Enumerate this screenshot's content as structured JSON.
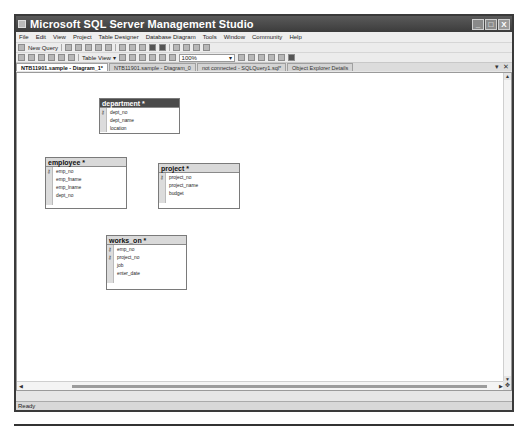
{
  "window": {
    "title": "Microsoft SQL Server Management Studio",
    "controls": {
      "minimize": "_",
      "maximize": "□",
      "close": "X"
    }
  },
  "menu": {
    "items": [
      "File",
      "Edit",
      "View",
      "Project",
      "Table Designer",
      "Database Diagram",
      "Tools",
      "Window",
      "Community",
      "Help"
    ]
  },
  "toolbar1": {
    "new_query_label": "New Query"
  },
  "toolbar2": {
    "table_view_label": "Table View ▾",
    "zoom_value": "100%"
  },
  "tabs": [
    {
      "label": "NTB11901.sample - Diagram_1*",
      "active": true
    },
    {
      "label": "NTB11901.sample - Diagram_0",
      "active": false
    },
    {
      "label": "not connected - SQLQuery1.sql*",
      "active": false
    },
    {
      "label": "Object Explorer Details",
      "active": false
    }
  ],
  "tab_controls": {
    "dropdown": "▾",
    "close": "✕"
  },
  "diagram": {
    "tables": [
      {
        "name": "department *",
        "columns": [
          {
            "name": "dept_no",
            "key": true
          },
          {
            "name": "dept_name",
            "key": false
          },
          {
            "name": "location",
            "key": false
          }
        ]
      },
      {
        "name": "employee *",
        "columns": [
          {
            "name": "emp_no",
            "key": true
          },
          {
            "name": "emp_fname",
            "key": false
          },
          {
            "name": "emp_lname",
            "key": false
          },
          {
            "name": "dept_no",
            "key": false
          }
        ]
      },
      {
        "name": "project *",
        "columns": [
          {
            "name": "project_no",
            "key": true
          },
          {
            "name": "project_name",
            "key": false
          },
          {
            "name": "budget",
            "key": false
          }
        ]
      },
      {
        "name": "works_on *",
        "columns": [
          {
            "name": "emp_no",
            "key": true
          },
          {
            "name": "project_no",
            "key": true
          },
          {
            "name": "job",
            "key": false
          },
          {
            "name": "enter_date",
            "key": false
          }
        ]
      }
    ]
  },
  "icons": {
    "key": "⚷",
    "scroll_up": "▲",
    "scroll_down": "▼",
    "scroll_left": "◀",
    "scroll_right": "▶",
    "navigator": "✥"
  },
  "status": {
    "text": "Ready"
  }
}
